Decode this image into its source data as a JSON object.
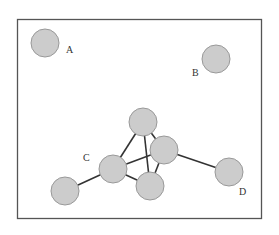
{
  "diagram": {
    "type": "graph",
    "frame": {
      "x": 17,
      "y": 19,
      "width": 245,
      "height": 200
    },
    "nodes": [
      {
        "id": "A",
        "label": "A",
        "cx": 45,
        "cy": 43,
        "r": 14,
        "label_x": 66,
        "label_y": 53
      },
      {
        "id": "B",
        "label": "B",
        "cx": 216,
        "cy": 59,
        "r": 14,
        "label_x": 192,
        "label_y": 76
      },
      {
        "id": "T",
        "label": "",
        "cx": 143,
        "cy": 122,
        "r": 14
      },
      {
        "id": "R",
        "label": "",
        "cx": 164,
        "cy": 150,
        "r": 14
      },
      {
        "id": "C",
        "label": "C",
        "cx": 113,
        "cy": 169,
        "r": 14,
        "label_x": 83,
        "label_y": 161
      },
      {
        "id": "M",
        "label": "",
        "cx": 150,
        "cy": 186,
        "r": 14
      },
      {
        "id": "L",
        "label": "",
        "cx": 65,
        "cy": 191,
        "r": 14
      },
      {
        "id": "D",
        "label": "D",
        "cx": 229,
        "cy": 172,
        "r": 14,
        "label_x": 239,
        "label_y": 195
      }
    ],
    "edges": [
      [
        "T",
        "C"
      ],
      [
        "T",
        "M"
      ],
      [
        "T",
        "R"
      ],
      [
        "C",
        "R"
      ],
      [
        "C",
        "M"
      ],
      [
        "R",
        "M"
      ],
      [
        "C",
        "L"
      ],
      [
        "R",
        "D"
      ]
    ],
    "labels": {
      "A": "A",
      "B": "B",
      "C": "C",
      "D": "D"
    }
  }
}
